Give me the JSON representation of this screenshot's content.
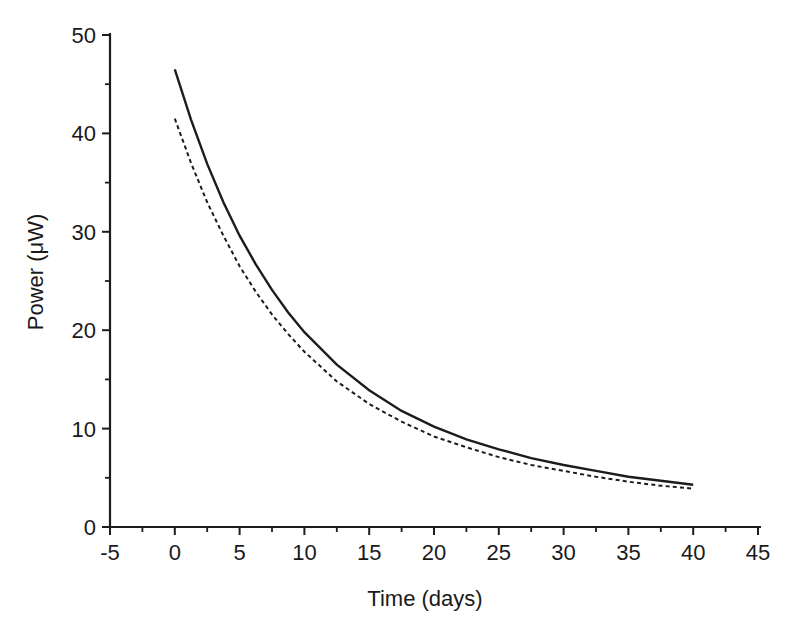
{
  "figure": {
    "background": "#ffffff",
    "ink_color": "#1c1c1c"
  },
  "chart_data": {
    "type": "line",
    "title": "",
    "xlabel": "Time (days)",
    "ylabel": "Power (μW)",
    "xlim": [
      -5,
      45
    ],
    "ylim": [
      0,
      50
    ],
    "grid": false,
    "legend": "none",
    "axis_color": "#1c1c1c",
    "x_major_ticks": [
      -5,
      0,
      5,
      10,
      15,
      20,
      25,
      30,
      35,
      40,
      45
    ],
    "x_tick_labels": [
      "-5",
      "0",
      "5",
      "10",
      "15",
      "20",
      "25",
      "30",
      "35",
      "40",
      "45"
    ],
    "x_minor_step": 2.5,
    "y_major_ticks": [
      0,
      10,
      20,
      30,
      40,
      50
    ],
    "y_tick_labels": [
      "0",
      "10",
      "20",
      "30",
      "40",
      "50"
    ],
    "y_minor_step": 5,
    "x": [
      0,
      1.25,
      2.5,
      3.75,
      5,
      6.25,
      7.5,
      8.75,
      10,
      12.5,
      15,
      17.5,
      20,
      22.5,
      25,
      27.5,
      30,
      32.5,
      35,
      37.5,
      40
    ],
    "series": [
      {
        "name": "solid-curve",
        "style": "solid",
        "color": "#1c1c1c",
        "values": [
          46.5,
          41.4,
          36.9,
          33.0,
          29.6,
          26.7,
          24.1,
          21.8,
          19.8,
          16.5,
          13.9,
          11.8,
          10.2,
          8.9,
          7.9,
          7.0,
          6.3,
          5.7,
          5.1,
          4.7,
          4.3
        ]
      },
      {
        "name": "dashed-curve",
        "style": "dashed",
        "color": "#1c1c1c",
        "values": [
          41.5,
          37.0,
          33.0,
          29.6,
          26.5,
          23.9,
          21.6,
          19.6,
          17.8,
          14.8,
          12.5,
          10.7,
          9.2,
          8.1,
          7.1,
          6.3,
          5.7,
          5.1,
          4.6,
          4.2,
          3.9
        ]
      }
    ]
  }
}
